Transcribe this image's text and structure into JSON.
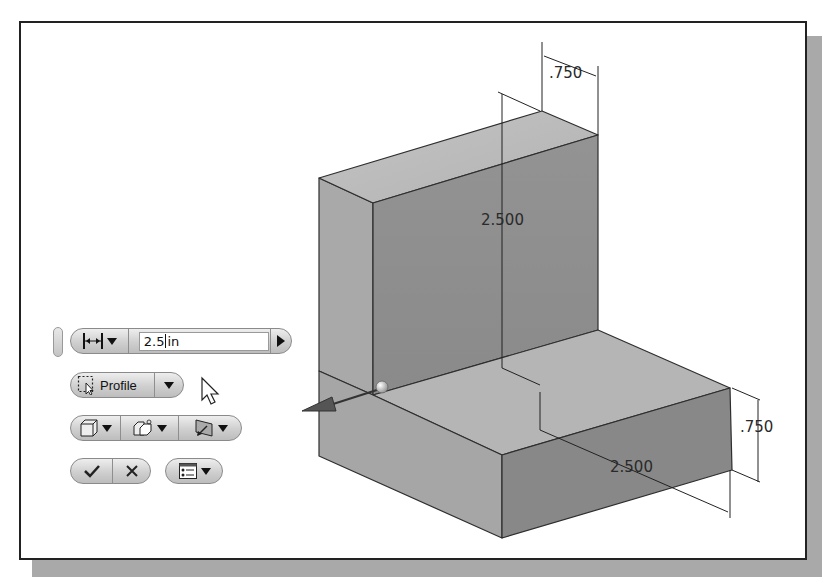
{
  "figure": {
    "frame_color": "#222222",
    "shadow_color": "#a9a9a9",
    "model_face_colors": {
      "top": "#b9b9b9",
      "left": "#a3a3a3",
      "front": "#8e8e8e",
      "right": "#7f7f7f"
    }
  },
  "dimensions": {
    "top_thickness": ".750",
    "vertical_height": "2.500",
    "base_length": "2.500",
    "base_thickness": ".750"
  },
  "mini_toolbar": {
    "distance_mode_icon": "linear-distance-icon",
    "distance_value": "2.5",
    "distance_units": "in",
    "apply_arrow_icon": "play-arrow-icon",
    "profile_label": "Profile",
    "profile_icon": "select-profile-icon",
    "output_icon": "solid-output-icon",
    "operation_icon": "join-operation-icon",
    "direction_icon": "direction-icon",
    "ok_icon": "checkmark-icon",
    "cancel_icon": "x-icon",
    "options_icon": "options-list-icon"
  },
  "cursor": {
    "icon": "mouse-pointer-icon"
  }
}
